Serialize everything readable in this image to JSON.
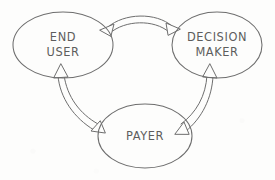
{
  "diagram": {
    "style": "hand-drawn sketch",
    "background_color": "#fdfdfc",
    "stroke_color": "#6e6e6e",
    "text_color": "#5d5d5d",
    "nodes": [
      {
        "id": "end-user",
        "label_line1": "END",
        "label_line2": "USER",
        "shape": "ellipse",
        "cx": 63,
        "cy": 45,
        "rx": 50,
        "ry": 33
      },
      {
        "id": "decision-maker",
        "label_line1": "DECISION",
        "label_line2": "MAKER",
        "shape": "ellipse",
        "cx": 217,
        "cy": 45,
        "rx": 45,
        "ry": 33
      },
      {
        "id": "payer",
        "label_line1": "PAYER",
        "label_line2": "",
        "shape": "ellipse",
        "cx": 145,
        "cy": 136,
        "rx": 47,
        "ry": 32
      }
    ],
    "edges": [
      {
        "id": "end-user-decision-maker",
        "from": "end-user",
        "to": "decision-maker",
        "direction": "bidirectional",
        "arrowhead_style": "hollow-triangle",
        "shaft_style": "double-line"
      },
      {
        "id": "end-user-payer",
        "from": "end-user",
        "to": "payer",
        "direction": "bidirectional",
        "arrowhead_style": "hollow-triangle",
        "shaft_style": "double-line"
      },
      {
        "id": "payer-decision-maker",
        "from": "payer",
        "to": "decision-maker",
        "direction": "bidirectional",
        "arrowhead_style": "hollow-triangle",
        "shaft_style": "double-line"
      }
    ]
  }
}
